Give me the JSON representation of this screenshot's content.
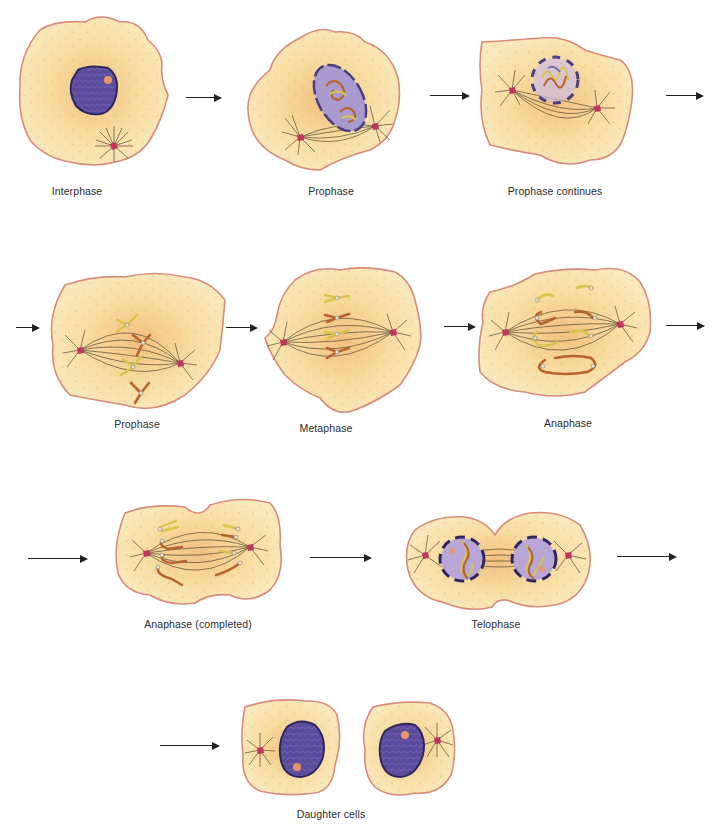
{
  "figure": {
    "colors": {
      "cytoplasm_fill": "#f7e0a6",
      "cytoplasm_center": "#f4c98a",
      "membrane": "#d98b7a",
      "nucleus": "#5a4a9a",
      "nucleus_outline": "#2f2660",
      "nuclear_envelope_faded": "#b7a6d6",
      "chromosome_yellow": "#d8c44a",
      "chromosome_orange": "#b8622e",
      "centriole": "#c2345e",
      "spindle": "#3a3020",
      "arrow": "#222222"
    },
    "stages": [
      {
        "id": "interphase",
        "label": "Interphase"
      },
      {
        "id": "prophase",
        "label": "Prophase"
      },
      {
        "id": "prophase-continues",
        "label": "Prophase continues"
      },
      {
        "id": "prophase-2",
        "label": "Prophase"
      },
      {
        "id": "metaphase",
        "label": "Metaphase"
      },
      {
        "id": "anaphase",
        "label": "Anaphase"
      },
      {
        "id": "anaphase-completed",
        "label": "Anaphase (completed)"
      },
      {
        "id": "telophase",
        "label": "Telophase"
      },
      {
        "id": "daughter-cells",
        "label": "Daughter cells"
      }
    ]
  }
}
